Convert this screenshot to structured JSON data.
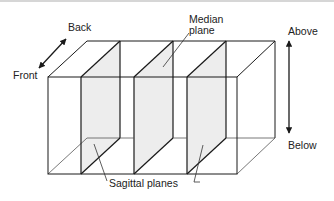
{
  "diagram": {
    "labels": {
      "back": "Back",
      "front": "Front",
      "median_line1": "Median",
      "median_line2": "plane",
      "above": "Above",
      "below": "Below",
      "sagittal": "Sagittal planes"
    },
    "colors": {
      "line": "#1a1a1a",
      "thin_line": "#555555",
      "plane_fill": "#ededed",
      "background": "#ffffff"
    }
  }
}
